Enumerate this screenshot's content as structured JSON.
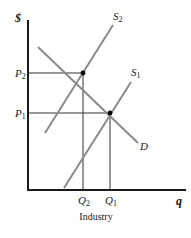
{
  "diagram": {
    "type": "supply-demand",
    "caption": "Industry",
    "y_axis_label": "$",
    "x_axis_label": "q",
    "curves": [
      {
        "name": "S2",
        "base": "S",
        "sub": "2",
        "color": "#8a8a8a"
      },
      {
        "name": "S1",
        "base": "S",
        "sub": "1",
        "color": "#8a8a8a"
      },
      {
        "name": "D",
        "base": "D",
        "sub": "",
        "color": "#8a8a8a"
      }
    ],
    "price_labels": [
      {
        "base": "P",
        "sub": "2"
      },
      {
        "base": "P",
        "sub": "1"
      }
    ],
    "quantity_labels": [
      {
        "base": "Q",
        "sub": "2"
      },
      {
        "base": "Q",
        "sub": "1"
      }
    ],
    "equilibria": [
      {
        "label": "S2 ∩ D",
        "price": "P2",
        "quantity": "Q2"
      },
      {
        "label": "S1 ∩ D",
        "price": "P1",
        "quantity": "Q1"
      }
    ],
    "colors": {
      "axis": "#1a1a1a",
      "curve": "#8a8a8a",
      "guide": "#333333",
      "point": "#000000"
    }
  }
}
